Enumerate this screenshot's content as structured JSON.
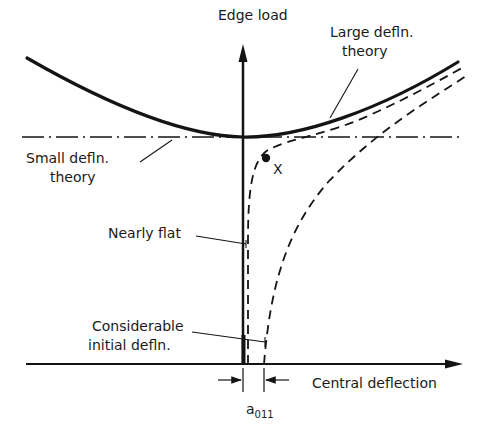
{
  "figure": {
    "type": "diagram"
  },
  "axes": {
    "y_label": "Edge load",
    "x_label": "Central deflection"
  },
  "labels": {
    "large_defln_line1": "Large defln.",
    "large_defln_line2": "theory",
    "small_defln_line1": "Small defln.",
    "small_defln_line2": "theory",
    "nearly_flat": "Nearly flat",
    "considerable_line1": "Considerable",
    "considerable_line2": "initial defln.",
    "point_marker": "X",
    "dimension_main": "a",
    "dimension_sub": "011"
  },
  "curves": [
    {
      "name": "Large defln. theory",
      "style": "solid-thick"
    },
    {
      "name": "Small defln. theory",
      "style": "dash-dot"
    },
    {
      "name": "Nearly flat",
      "style": "dashed"
    },
    {
      "name": "Considerable initial defln.",
      "style": "dashed"
    }
  ],
  "colors": {
    "ink": "#141414",
    "background": "#ffffff"
  }
}
